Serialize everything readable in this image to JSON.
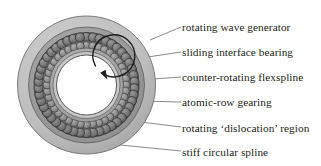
{
  "figure": {
    "type": "cross-section-diagram",
    "center": {
      "x": 86.5,
      "y": 85
    },
    "background_color": "#ffffff",
    "ink_color": "#231f20"
  },
  "rings": [
    {
      "name": "stiff circular spline",
      "outer_radius": 69,
      "inner_radius": 58,
      "fill": "#b9b9b9",
      "stroke": "#6f6f6f"
    },
    {
      "name": "rotating dislocation region",
      "outer_radius": 58,
      "inner_radius": 52,
      "fill": "#9d9d9d",
      "stroke": "#5e5e5e"
    },
    {
      "name": "atomic-row gearing",
      "outer_radius": 52,
      "inner_radius": 44,
      "fill": "#585858",
      "stroke": "#3a3a3a"
    },
    {
      "name": "counter-rotating flexspline",
      "outer_radius": 44,
      "inner_radius": 38,
      "fill": "#8c8c8c",
      "stroke": "#4a4a4a"
    },
    {
      "name": "sliding interface bearing",
      "outer_radius": 38,
      "inner_radius": 30,
      "fill": "#a8a8a8",
      "stroke": "#565656"
    },
    {
      "name": "rotating wave generator",
      "outer_radius": 30,
      "inner_radius": 0,
      "fill": "#ffffff",
      "stroke": "#4a4a4a"
    }
  ],
  "ball_rings": [
    {
      "name": "outer-ball-ring",
      "radius": 48,
      "ball_radius": 4.6,
      "count": 46,
      "fill": "#6e6e6e",
      "stroke": "#2e2e2e"
    },
    {
      "name": "inner-ball-ring",
      "radius": 39.5,
      "ball_radius": 4.0,
      "count": 40,
      "fill": "#8f8f8f",
      "stroke": "#3c3c3c"
    }
  ],
  "rotation_arrow": {
    "name": "clockwise-rotation-arrow",
    "radius": 21,
    "direction": "clockwise",
    "gap_side": "right"
  },
  "labels": [
    {
      "id": "rotating-wave-generator",
      "text": "rotating wave generator",
      "x": 182,
      "y": 22,
      "leader": {
        "x1": 181,
        "y1": 27,
        "x2": 150,
        "y2": 40
      }
    },
    {
      "id": "sliding-interface-bearing",
      "text": "sliding interface bearing",
      "x": 182,
      "y": 47,
      "leader": {
        "x1": 181,
        "y1": 52,
        "x2": 141,
        "y2": 58
      }
    },
    {
      "id": "counter-rotating-flexspline",
      "text": "counter-rotating flexspline",
      "x": 182,
      "y": 72,
      "leader": {
        "x1": 181,
        "y1": 77,
        "x2": 139,
        "y2": 80
      }
    },
    {
      "id": "atomic-row-gearing",
      "text": "atomic-row gearing",
      "x": 182,
      "y": 97,
      "leader": {
        "x1": 181,
        "y1": 102,
        "x2": 141,
        "y2": 101
      }
    },
    {
      "id": "rotating-dislocation-region",
      "text": "rotating ‘dislocation’ region",
      "x": 182,
      "y": 123,
      "leader": {
        "x1": 181,
        "y1": 127,
        "x2": 125,
        "y2": 120
      }
    },
    {
      "id": "stiff-circular-spline",
      "text": "stiff circular spline",
      "x": 182,
      "y": 147,
      "leader": {
        "x1": 181,
        "y1": 151,
        "x2": 80,
        "y2": 141
      }
    }
  ]
}
